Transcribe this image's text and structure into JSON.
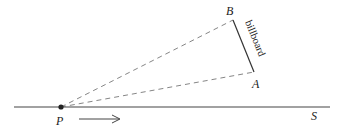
{
  "diagram": {
    "points": {
      "P": {
        "label": "P",
        "x": 61,
        "y": 107
      },
      "A": {
        "label": "A",
        "x": 254,
        "y": 72
      },
      "B": {
        "label": "B",
        "x": 233,
        "y": 20
      }
    },
    "line_label": "S",
    "billboard_label": "billboard",
    "colors": {
      "line": "#333333",
      "dashed": "#666666"
    }
  }
}
